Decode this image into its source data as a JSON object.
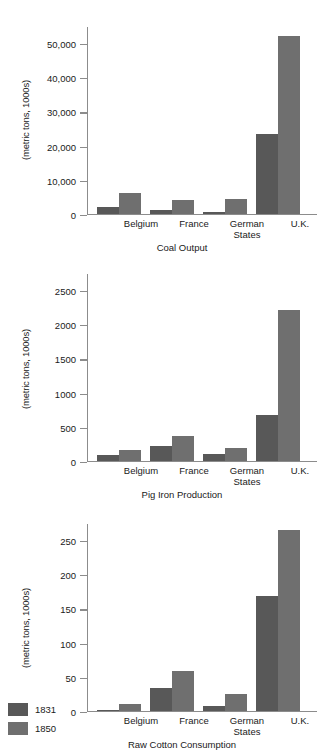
{
  "figure": {
    "series_labels": [
      "1831",
      "1850"
    ],
    "colors": {
      "series_1831": "#585858",
      "series_1850": "#6f6f6f",
      "axis": "#8c8c8c"
    }
  },
  "legend": {
    "position": "bottom-left",
    "items": [
      {
        "label": "1831",
        "color": "#585858"
      },
      {
        "label": "1850",
        "color": "#6f6f6f"
      }
    ]
  },
  "chart_data": [
    {
      "type": "bar",
      "title": "Coal Output",
      "xlabel": "",
      "ylabel": "(metric tons, 1000s)",
      "categories": [
        "Belgium",
        "France",
        "German\nStates",
        "U.K."
      ],
      "series": [
        {
          "name": "1831",
          "values": [
            2000,
            1300,
            600,
            23500
          ]
        },
        {
          "name": "1850",
          "values": [
            6200,
            4100,
            4500,
            52000
          ]
        }
      ],
      "ylim": [
        0,
        55000
      ],
      "yticks": [
        0,
        10000,
        20000,
        30000,
        40000,
        50000
      ],
      "yticklabels": [
        "0",
        "10,000",
        "20,000",
        "30,000",
        "40,000",
        "50,000"
      ],
      "grid": false,
      "legend": "bottom-left"
    },
    {
      "type": "bar",
      "title": "Pig Iron Production",
      "xlabel": "",
      "ylabel": "(metric tons, 1000s)",
      "categories": [
        "Belgium",
        "France",
        "German\nStates",
        "U.K."
      ],
      "series": [
        {
          "name": "1831",
          "values": [
            85,
            215,
            100,
            680
          ]
        },
        {
          "name": "1850",
          "values": [
            160,
            370,
            185,
            2210
          ]
        }
      ],
      "ylim": [
        0,
        2750
      ],
      "yticks": [
        0,
        500,
        1000,
        1500,
        2000,
        2500
      ],
      "yticklabels": [
        "0",
        "500",
        "1000",
        "1500",
        "2000",
        "2500"
      ],
      "grid": false,
      "legend": "bottom-left"
    },
    {
      "type": "bar",
      "title": "Raw Cotton Consumption",
      "xlabel": "",
      "ylabel": "(metric tons, 1000s)",
      "categories": [
        "Belgium",
        "France",
        "German\nStates",
        "U.K."
      ],
      "series": [
        {
          "name": "1831",
          "values": [
            1,
            33,
            8,
            168
          ]
        },
        {
          "name": "1850",
          "values": [
            10,
            58,
            25,
            265
          ]
        }
      ],
      "ylim": [
        0,
        275
      ],
      "yticks": [
        0,
        50,
        100,
        150,
        200,
        250
      ],
      "yticklabels": [
        "0",
        "50",
        "100",
        "150",
        "200",
        "250"
      ],
      "grid": false,
      "legend": "bottom-left"
    }
  ]
}
